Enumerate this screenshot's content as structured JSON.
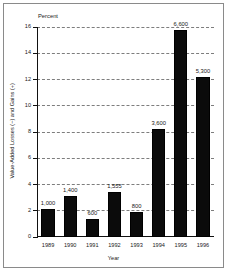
{
  "figure": {
    "unit_label": "Percent",
    "frame": true,
    "background_color": "#ffffff",
    "bar_color": "#0b0b0b",
    "grid_color": "#7d7d7d",
    "axis_color": "#111111"
  },
  "chart_data": {
    "type": "bar",
    "title": "",
    "subtitle": "",
    "unit_label": "Percent",
    "xlabel": "Year",
    "ylabel": "Value-Added Losses (−) and Gains (+)",
    "categories": [
      "1989",
      "1990",
      "1991",
      "1992",
      "1993",
      "1994",
      "1995",
      "1996"
    ],
    "values": [
      2.1,
      3.1,
      1.35,
      3.45,
      1.9,
      8.2,
      15.8,
      12.2
    ],
    "data_labels": [
      "1,000",
      "1,400",
      "600",
      "1,555",
      "800",
      "3,600",
      "6,600",
      "5,300"
    ],
    "ylim": [
      0,
      16
    ],
    "yticks": [
      0,
      2,
      4,
      6,
      8,
      10,
      12,
      14,
      16
    ],
    "ytick_labels": [
      "0",
      "2",
      "4",
      "6",
      "8",
      "10",
      "12",
      "14",
      "16"
    ],
    "grid": true,
    "grid_axis": "y",
    "legend": null,
    "legend_position": "none"
  },
  "axes": {
    "y_ticks": [
      {
        "value": 16,
        "label": "16"
      },
      {
        "value": 14,
        "label": "14"
      },
      {
        "value": 12,
        "label": "12"
      },
      {
        "value": 10,
        "label": "10"
      },
      {
        "value": 8,
        "label": "8"
      },
      {
        "value": 6,
        "label": "6"
      },
      {
        "value": 4,
        "label": "4"
      },
      {
        "value": 2,
        "label": "2"
      },
      {
        "value": 0,
        "label": "0"
      }
    ],
    "x_title": "Year",
    "y_title": "Value-Added Losses (−) and Gains (+)"
  },
  "bars": [
    {
      "category": "1989",
      "value": 2.1,
      "label": "1,000"
    },
    {
      "category": "1990",
      "value": 3.1,
      "label": "1,400"
    },
    {
      "category": "1991",
      "value": 1.35,
      "label": "600"
    },
    {
      "category": "1992",
      "value": 3.45,
      "label": "1,555"
    },
    {
      "category": "1993",
      "value": 1.9,
      "label": "800"
    },
    {
      "category": "1994",
      "value": 8.2,
      "label": "3,600"
    },
    {
      "category": "1995",
      "value": 15.8,
      "label": "6,600"
    },
    {
      "category": "1996",
      "value": 12.2,
      "label": "5,300"
    }
  ]
}
